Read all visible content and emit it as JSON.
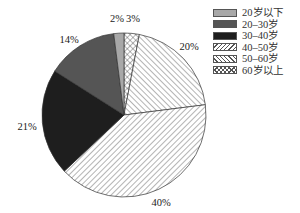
{
  "chart_data": {
    "type": "pie",
    "title": "",
    "start_angle": "12 o'clock",
    "direction": "clockwise",
    "categories": [
      "60岁以上",
      "50–60岁",
      "40–50岁",
      "30–40岁",
      "20–30岁",
      "20岁以下"
    ],
    "values": [
      3,
      20,
      40,
      21,
      14,
      2
    ],
    "value_labels": [
      "3%",
      "20%",
      "40%",
      "21%",
      "14%",
      "2%"
    ],
    "fills": [
      "crosshatch",
      "back-diagonal-hatch",
      "forward-diagonal-hatch",
      "#1e1e1e",
      "#555555",
      "#a8a8a8"
    ],
    "legend": {
      "position": "right-top",
      "entries": [
        "20岁以下",
        "20–30岁",
        "30–40岁",
        "40–50岁",
        "50–60岁",
        "60岁以上"
      ]
    }
  },
  "labels": {
    "p60plus": "3%",
    "p50_60": "20%",
    "p40_50": "40%",
    "p30_40": "21%",
    "p20_30": "14%",
    "p20below": "2%"
  },
  "legend": {
    "items": [
      {
        "label": "20岁以下"
      },
      {
        "label": "20–30岁"
      },
      {
        "label": "30–40岁"
      },
      {
        "label": "40–50岁"
      },
      {
        "label": "50–60岁"
      },
      {
        "label": "60岁以上"
      }
    ]
  }
}
